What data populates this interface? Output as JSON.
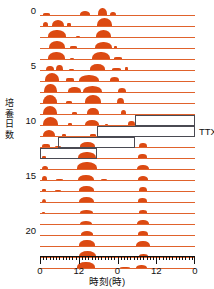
{
  "figure": {
    "type": "double-plotted-actogram",
    "axis_title_y": "培養日数",
    "axis_title_x": "時刻(時)",
    "ttx_label": "TTX",
    "colors": {
      "activity": "#dc4a12",
      "baseline": "#e0622c",
      "outline": "#4a4a52",
      "axis": "#111111",
      "background": "#ffffff"
    }
  },
  "chart_data": {
    "type": "bar",
    "title": "",
    "xlabel": "時刻(時)",
    "ylabel": "培養日数",
    "xlim": [
      0,
      48
    ],
    "ylim": [
      0,
      23
    ],
    "grid": false,
    "legend": null,
    "x_tick_labels": [
      "0",
      "12",
      "0",
      "12",
      "0"
    ],
    "x_tick_values": [
      0,
      12,
      24,
      36,
      48
    ],
    "y_tick_labels": [
      "0",
      "5",
      "10",
      "15",
      "20"
    ],
    "y_tick_values": [
      0,
      5,
      10,
      15,
      20
    ],
    "minor_tick_interval_hours": 1,
    "annotations": [
      {
        "text": "TTX",
        "x": 48,
        "y": 11
      }
    ],
    "treatment_outline": {
      "label": "TTX",
      "description": "stepped outline marking TTX application window across days 10-13",
      "steps": [
        {
          "day_start": 10.0,
          "day_end": 11.0,
          "hour_start": 29.5,
          "hour_end": 48.0
        },
        {
          "day_start": 11.0,
          "day_end": 12.0,
          "hour_start": 17.5,
          "hour_end": 48.0
        },
        {
          "day_start": 12.0,
          "day_end": 13.0,
          "hour_start": 5.5,
          "hour_end": 29.5
        },
        {
          "day_start": 13.0,
          "day_end": 14.0,
          "hour_start": 0.0,
          "hour_end": 17.5
        }
      ]
    },
    "categories": [
      "day 0",
      "day 1",
      "day 2",
      "day 3",
      "day 4",
      "day 5",
      "day 6",
      "day 7",
      "day 8",
      "day 9",
      "day 10",
      "day 11",
      "day 12",
      "day 13",
      "day 14",
      "day 15",
      "day 16",
      "day 17",
      "day 18",
      "day 19",
      "day 20",
      "day 21",
      "day 22",
      "day 23"
    ],
    "series": [
      {
        "name": "locomotor activity",
        "unit": "relative activity",
        "rows": [
          {
            "day": 0,
            "bursts": [
              {
                "start": 0.8,
                "end": 3.0,
                "height": 0.22,
                "shape": "flat"
              },
              {
                "start": 12.4,
                "end": 15.6,
                "height": 0.4,
                "shape": "hump"
              },
              {
                "start": 17.9,
                "end": 20.6,
                "height": 0.72,
                "shape": "hump"
              },
              {
                "start": 21.6,
                "end": 23.4,
                "height": 0.34,
                "shape": "hump"
              }
            ]
          },
          {
            "day": 1,
            "bursts": [
              {
                "start": 0.9,
                "end": 2.6,
                "height": 0.38,
                "shape": "hump"
              },
              {
                "start": 3.6,
                "end": 7.4,
                "height": 0.7,
                "shape": "hump"
              },
              {
                "start": 8.4,
                "end": 9.6,
                "height": 0.26,
                "shape": "flat"
              },
              {
                "start": 17.6,
                "end": 22.4,
                "height": 0.86,
                "shape": "hump"
              }
            ]
          },
          {
            "day": 2,
            "bursts": [
              {
                "start": 2.6,
                "end": 8.0,
                "height": 0.8,
                "shape": "hump"
              },
              {
                "start": 11.0,
                "end": 12.4,
                "height": 0.14,
                "shape": "flat"
              },
              {
                "start": 17.2,
                "end": 22.0,
                "height": 0.76,
                "shape": "hump"
              }
            ]
          },
          {
            "day": 3,
            "bursts": [
              {
                "start": 2.8,
                "end": 7.8,
                "height": 0.78,
                "shape": "hump"
              },
              {
                "start": 9.4,
                "end": 11.4,
                "height": 0.18,
                "shape": "flat"
              },
              {
                "start": 17.0,
                "end": 22.2,
                "height": 0.68,
                "shape": "hump"
              },
              {
                "start": 23.0,
                "end": 24.0,
                "height": 0.16,
                "shape": "flat"
              }
            ]
          },
          {
            "day": 4,
            "bursts": [
              {
                "start": 2.4,
                "end": 7.6,
                "height": 0.74,
                "shape": "hump"
              },
              {
                "start": 9.2,
                "end": 10.6,
                "height": 0.14,
                "shape": "flat"
              },
              {
                "start": 16.2,
                "end": 21.6,
                "height": 0.74,
                "shape": "hump"
              },
              {
                "start": 22.8,
                "end": 25.4,
                "height": 0.18,
                "shape": "flat"
              }
            ]
          },
          {
            "day": 5,
            "bursts": [
              {
                "start": 1.8,
                "end": 4.2,
                "height": 0.46,
                "shape": "hump"
              },
              {
                "start": 5.0,
                "end": 7.2,
                "height": 0.56,
                "shape": "hump"
              },
              {
                "start": 9.0,
                "end": 10.4,
                "height": 0.14,
                "shape": "flat"
              },
              {
                "start": 15.6,
                "end": 20.2,
                "height": 0.6,
                "shape": "hump"
              },
              {
                "start": 22.4,
                "end": 25.2,
                "height": 0.22,
                "shape": "flat"
              },
              {
                "start": 26.4,
                "end": 27.4,
                "height": 0.26,
                "shape": "flat"
              }
            ]
          },
          {
            "day": 6,
            "bursts": [
              {
                "start": 1.4,
                "end": 6.0,
                "height": 0.84,
                "shape": "hump"
              },
              {
                "start": 8.2,
                "end": 10.4,
                "height": 0.26,
                "shape": "flat"
              },
              {
                "start": 12.0,
                "end": 18.2,
                "height": 0.66,
                "shape": "hump"
              },
              {
                "start": 21.6,
                "end": 24.6,
                "height": 0.4,
                "shape": "hump"
              }
            ]
          },
          {
            "day": 7,
            "bursts": [
              {
                "start": 1.2,
                "end": 5.2,
                "height": 0.88,
                "shape": "hump"
              },
              {
                "start": 8.6,
                "end": 12.6,
                "height": 0.5,
                "shape": "hump"
              },
              {
                "start": 13.2,
                "end": 19.2,
                "height": 0.7,
                "shape": "hump"
              },
              {
                "start": 24.0,
                "end": 26.6,
                "height": 0.44,
                "shape": "hump"
              }
            ]
          },
          {
            "day": 8,
            "bursts": [
              {
                "start": 1.0,
                "end": 5.4,
                "height": 0.92,
                "shape": "hump"
              },
              {
                "start": 8.0,
                "end": 10.0,
                "height": 0.22,
                "shape": "flat"
              },
              {
                "start": 13.8,
                "end": 18.8,
                "height": 0.82,
                "shape": "hump"
              },
              {
                "start": 23.8,
                "end": 26.0,
                "height": 0.56,
                "shape": "hump"
              }
            ]
          },
          {
            "day": 9,
            "bursts": [
              {
                "start": 0.8,
                "end": 5.4,
                "height": 0.88,
                "shape": "hump"
              },
              {
                "start": 9.8,
                "end": 11.6,
                "height": 0.2,
                "shape": "flat"
              },
              {
                "start": 14.6,
                "end": 18.2,
                "height": 0.62,
                "shape": "hump"
              },
              {
                "start": 25.0,
                "end": 26.6,
                "height": 0.4,
                "shape": "hump"
              }
            ]
          },
          {
            "day": 10,
            "bursts": [
              {
                "start": 0.8,
                "end": 5.6,
                "height": 0.86,
                "shape": "hump"
              },
              {
                "start": 8.6,
                "end": 10.0,
                "height": 0.16,
                "shape": "flat"
              },
              {
                "start": 14.0,
                "end": 18.4,
                "height": 0.56,
                "shape": "hump"
              },
              {
                "start": 20.0,
                "end": 21.0,
                "height": 0.14,
                "shape": "flat"
              },
              {
                "start": 27.4,
                "end": 29.4,
                "height": 0.4,
                "shape": "hump"
              }
            ]
          },
          {
            "day": 11,
            "bursts": [
              {
                "start": 0.8,
                "end": 4.6,
                "height": 0.66,
                "shape": "hump"
              },
              {
                "start": 6.8,
                "end": 8.2,
                "height": 0.16,
                "shape": "flat"
              },
              {
                "start": 15.6,
                "end": 17.4,
                "height": 0.18,
                "shape": "flat"
              }
            ]
          },
          {
            "day": 12,
            "bursts": [
              {
                "start": 0.6,
                "end": 3.0,
                "height": 0.28,
                "shape": "flat"
              },
              {
                "start": 4.6,
                "end": 6.4,
                "height": 0.14,
                "shape": "flat"
              },
              {
                "start": 12.4,
                "end": 17.0,
                "height": 0.5,
                "shape": "hump"
              },
              {
                "start": 30.8,
                "end": 33.2,
                "height": 0.4,
                "shape": "hump"
              }
            ]
          },
          {
            "day": 13,
            "bursts": [
              {
                "start": 0.6,
                "end": 2.0,
                "height": 0.2,
                "shape": "flat"
              },
              {
                "start": 11.8,
                "end": 17.2,
                "height": 0.68,
                "shape": "hump"
              },
              {
                "start": 30.4,
                "end": 33.0,
                "height": 0.42,
                "shape": "hump"
              }
            ]
          },
          {
            "day": 14,
            "bursts": [
              {
                "start": 0.6,
                "end": 2.4,
                "height": 0.34,
                "shape": "hump"
              },
              {
                "start": 11.6,
                "end": 17.6,
                "height": 0.72,
                "shape": "hump"
              },
              {
                "start": 30.0,
                "end": 33.6,
                "height": 0.46,
                "shape": "hump"
              }
            ]
          },
          {
            "day": 15,
            "bursts": [
              {
                "start": 0.6,
                "end": 2.2,
                "height": 0.4,
                "shape": "hump"
              },
              {
                "start": 5.0,
                "end": 7.0,
                "height": 0.08,
                "shape": "flat"
              },
              {
                "start": 11.8,
                "end": 16.8,
                "height": 0.58,
                "shape": "hump"
              },
              {
                "start": 18.8,
                "end": 20.6,
                "height": 0.12,
                "shape": "flat"
              },
              {
                "start": 30.2,
                "end": 33.4,
                "height": 0.42,
                "shape": "hump"
              }
            ]
          },
          {
            "day": 16,
            "bursts": [
              {
                "start": 0.6,
                "end": 1.8,
                "height": 0.18,
                "shape": "flat"
              },
              {
                "start": 4.6,
                "end": 6.6,
                "height": 0.06,
                "shape": "flat"
              },
              {
                "start": 12.0,
                "end": 16.6,
                "height": 0.52,
                "shape": "hump"
              },
              {
                "start": 30.6,
                "end": 33.0,
                "height": 0.44,
                "shape": "hump"
              }
            ]
          },
          {
            "day": 17,
            "bursts": [
              {
                "start": 0.6,
                "end": 2.0,
                "height": 0.36,
                "shape": "hump"
              },
              {
                "start": 12.0,
                "end": 16.8,
                "height": 0.56,
                "shape": "hump"
              },
              {
                "start": 30.4,
                "end": 33.2,
                "height": 0.4,
                "shape": "hump"
              }
            ]
          },
          {
            "day": 18,
            "bursts": [
              {
                "start": 0.6,
                "end": 1.6,
                "height": 0.14,
                "shape": "flat"
              },
              {
                "start": 12.4,
                "end": 16.4,
                "height": 0.34,
                "shape": "hump"
              },
              {
                "start": 30.6,
                "end": 33.0,
                "height": 0.3,
                "shape": "hump"
              }
            ]
          },
          {
            "day": 19,
            "bursts": [
              {
                "start": 12.4,
                "end": 16.2,
                "height": 0.36,
                "shape": "hump"
              },
              {
                "start": 30.0,
                "end": 33.6,
                "height": 0.44,
                "shape": "hump"
              }
            ]
          },
          {
            "day": 20,
            "bursts": [
              {
                "start": 12.6,
                "end": 16.4,
                "height": 0.38,
                "shape": "hump"
              },
              {
                "start": 30.4,
                "end": 33.4,
                "height": 0.38,
                "shape": "hump"
              }
            ]
          },
          {
            "day": 21,
            "bursts": [
              {
                "start": 12.2,
                "end": 17.0,
                "height": 0.6,
                "shape": "hump"
              },
              {
                "start": 29.8,
                "end": 34.0,
                "height": 0.56,
                "shape": "hump"
              }
            ]
          },
          {
            "day": 22,
            "bursts": [
              {
                "start": 12.0,
                "end": 17.4,
                "height": 0.62,
                "shape": "hump"
              },
              {
                "start": 30.6,
                "end": 33.4,
                "height": 0.3,
                "shape": "hump"
              }
            ]
          },
          {
            "day": 23,
            "bursts": [
              {
                "start": 11.6,
                "end": 17.0,
                "height": 0.62,
                "shape": "hump"
              },
              {
                "start": 24.8,
                "end": 28.0,
                "height": 0.12,
                "shape": "flat"
              },
              {
                "start": 29.8,
                "end": 33.2,
                "height": 0.36,
                "shape": "hump"
              }
            ]
          }
        ]
      }
    ]
  }
}
